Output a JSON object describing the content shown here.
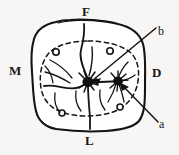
{
  "figure": {
    "caption_none": "",
    "background_color": "#f7f6f4",
    "ink_color": "#151515"
  },
  "labels": {
    "orientation": [
      {
        "key": "facial",
        "text": "F",
        "position": "top"
      },
      {
        "key": "mesial",
        "text": "M",
        "position": "left"
      },
      {
        "key": "distal",
        "text": "D",
        "position": "right"
      },
      {
        "key": "lingual",
        "text": "L",
        "position": "bottom"
      }
    ],
    "callouts": [
      {
        "key": "b",
        "text": "b",
        "position": "upper-right",
        "points_to": "central-pit"
      },
      {
        "key": "a",
        "text": "a",
        "position": "lower-right",
        "points_to": "distal-pit"
      }
    ]
  },
  "drawing": {
    "outline_name": "tooth-crown-outline",
    "dashed_name": "cementoenamel-dashed-contour",
    "pits": [
      {
        "name": "pit-upper-left"
      },
      {
        "name": "pit-upper-right"
      },
      {
        "name": "pit-lower-left"
      },
      {
        "name": "pit-lower-right"
      }
    ],
    "fissures": [
      {
        "name": "central-fissure-vertical-upper"
      },
      {
        "name": "central-fissure-vertical-lower"
      },
      {
        "name": "mesial-fissure-branch"
      },
      {
        "name": "distal-fissure-branch"
      }
    ],
    "blotches": [
      {
        "name": "central-pit-blotch"
      },
      {
        "name": "distal-pit-blotch"
      }
    ]
  }
}
